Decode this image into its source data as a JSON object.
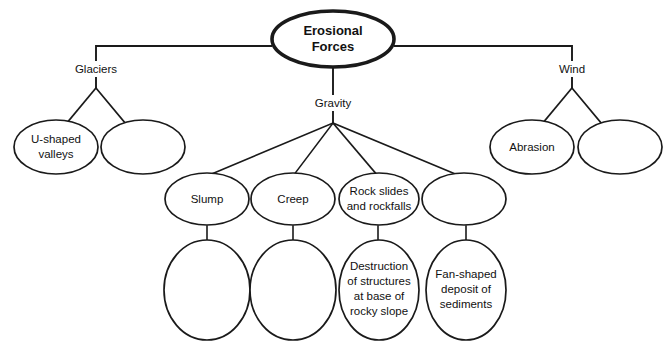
{
  "diagram": {
    "type": "concept-map",
    "colors": {
      "stroke": "#1a1a1a",
      "fill": "#ffffff",
      "text": "#111111",
      "background": "#ffffff"
    },
    "top_artifact_text": "",
    "root": {
      "label_line1": "Erosional",
      "label_line2": "Forces"
    },
    "branch_labels": {
      "glaciers": "Glaciers",
      "gravity": "Gravity",
      "wind": "Wind"
    },
    "nodes": {
      "glaciers_child_1": {
        "lines": [
          "U-shaped",
          "valleys"
        ]
      },
      "glaciers_child_2": {
        "lines": []
      },
      "gravity_child_1": {
        "lines": [
          "Slump"
        ]
      },
      "gravity_child_2": {
        "lines": [
          "Creep"
        ]
      },
      "gravity_child_3": {
        "lines": [
          "Rock slides",
          "and rockfalls"
        ]
      },
      "gravity_child_4": {
        "lines": []
      },
      "wind_child_1": {
        "lines": [
          "Abrasion"
        ]
      },
      "wind_child_2": {
        "lines": []
      },
      "slump_detail": {
        "lines": []
      },
      "creep_detail": {
        "lines": []
      },
      "rockslides_detail": {
        "lines": [
          "Destruction",
          "of structures",
          "at base of",
          "rocky slope"
        ]
      },
      "gravity_child_4_detail": {
        "lines": [
          "Fan-shaped",
          "deposit of",
          "sediments"
        ]
      }
    }
  }
}
